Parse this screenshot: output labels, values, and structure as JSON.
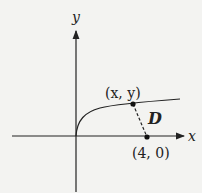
{
  "diagram": {
    "axes": {
      "x_label": "x",
      "y_label": "y"
    },
    "curve": "y = sqrt(x)",
    "points": [
      {
        "label": "(x, y)",
        "role": "point-on-curve"
      },
      {
        "label": "(4, 0)",
        "role": "fixed-point"
      }
    ],
    "distance_label": "D",
    "colors": {
      "ink": "#222222",
      "background": "#f3f3f1"
    }
  }
}
